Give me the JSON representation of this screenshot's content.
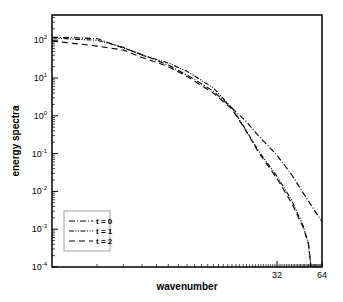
{
  "chart_data": {
    "type": "line",
    "title": "",
    "xlabel": "wavenumber",
    "ylabel": "energy spectra",
    "xscale": "log2",
    "yscale": "log10",
    "xlim": [
      1,
      64
    ],
    "ylim": [
      0.0001,
      460
    ],
    "x_tick_labels": [
      "32",
      "64"
    ],
    "y_tick_labels": [
      {
        "base": "10",
        "exp": "2"
      },
      {
        "base": "10",
        "exp": "1"
      },
      {
        "base": "10",
        "exp": "0"
      },
      {
        "base": "10",
        "exp": "-1"
      },
      {
        "base": "10",
        "exp": "-2"
      },
      {
        "base": "10",
        "exp": "-3"
      },
      {
        "base": "10",
        "exp": "-4"
      }
    ],
    "grid": false,
    "legend_position": "lower left",
    "series": [
      {
        "name": "t = 0",
        "style": "dash-dot",
        "x": [
          1,
          1.5,
          2,
          3,
          4,
          6,
          8,
          12,
          16,
          20,
          24,
          32,
          40,
          48,
          56,
          64
        ],
        "y": [
          120,
          115,
          110,
          62,
          42,
          22,
          12,
          4.5,
          1.6,
          0.7,
          0.3,
          0.09,
          0.028,
          0.009,
          0.0035,
          0.0016
        ]
      },
      {
        "name": "t = 1",
        "style": "dash-dot-dot",
        "x": [
          1,
          1.5,
          2,
          3,
          4,
          6,
          8,
          12,
          16,
          20,
          24,
          32,
          40,
          48,
          52,
          54
        ],
        "y": [
          115,
          105,
          100,
          65,
          40,
          25,
          15,
          5.5,
          1.6,
          0.4,
          0.12,
          0.025,
          0.006,
          0.0012,
          0.0004,
          0.0001
        ]
      },
      {
        "name": "t = 2",
        "style": "dashed",
        "x": [
          1,
          1.5,
          2,
          3,
          4,
          6,
          8,
          12,
          16,
          20,
          24,
          32,
          40,
          48,
          52,
          54
        ],
        "y": [
          95,
          80,
          70,
          55,
          35,
          20,
          11,
          4.0,
          1.5,
          0.38,
          0.11,
          0.022,
          0.005,
          0.0011,
          0.0004,
          0.0001
        ]
      }
    ]
  }
}
